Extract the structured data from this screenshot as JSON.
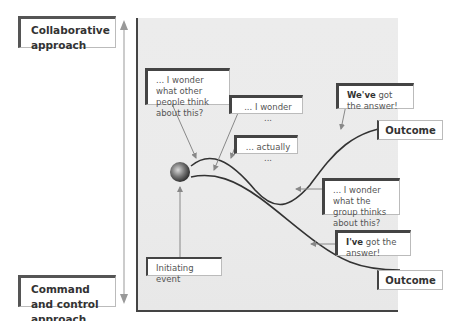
{
  "axis": {
    "top_label": "Collaborative approach",
    "bottom_label": "Command and control approach"
  },
  "callouts": {
    "others_think": "... I wonder what other people think about this?",
    "i_wonder": "... I wonder ...",
    "actually": "... actually ...",
    "weve_bold": "We've",
    "weve_rest": " got the answer!",
    "group_thinks": "... I wonder what the group thinks about this?",
    "ive_bold": "I've",
    "ive_rest": " got the answer!",
    "initiating": "Initiating event"
  },
  "outcomes": {
    "top": "Outcome",
    "bottom": "Outcome"
  },
  "colors": {
    "panel_bg": "#ebebeb",
    "curve": "#333333",
    "arrow": "#888888",
    "frame": "#444444"
  }
}
